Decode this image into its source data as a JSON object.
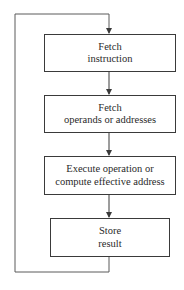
{
  "diagram": {
    "type": "flowchart",
    "steps": [
      {
        "id": "fetch-instruction",
        "line1": "Fetch",
        "line2": "instruction"
      },
      {
        "id": "fetch-operands",
        "line1": "Fetch",
        "line2": "operands or addresses"
      },
      {
        "id": "execute",
        "line1": "Execute operation or",
        "line2": "compute effective address"
      },
      {
        "id": "store",
        "line1": "Store",
        "line2": "result"
      }
    ],
    "edges": [
      {
        "from": "fetch-instruction",
        "to": "fetch-operands"
      },
      {
        "from": "fetch-operands",
        "to": "execute"
      },
      {
        "from": "execute",
        "to": "store"
      },
      {
        "from": "store",
        "to": "fetch-instruction",
        "kind": "loop-back"
      }
    ],
    "colors": {
      "line": "#3a3a3a",
      "background": "#ffffff"
    }
  }
}
